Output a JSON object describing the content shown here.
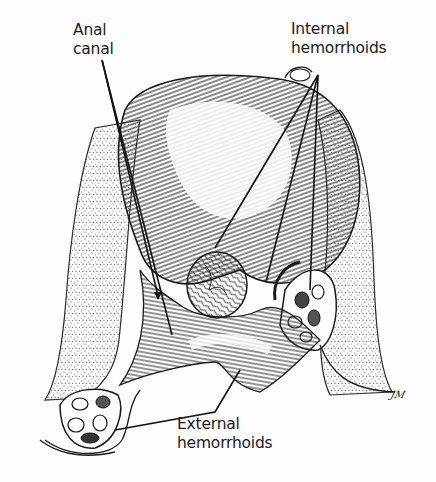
{
  "figure": {
    "type": "anatomical line illustration",
    "style": {
      "ink_color": "#1a1a1a",
      "paper_color": "#fdfdfd",
      "stipple_color": "#555555"
    }
  },
  "labels": {
    "anal_canal": {
      "lines": [
        "Anal",
        "canal"
      ]
    },
    "internal_hemorrhoids": {
      "lines": [
        "Internal",
        "hemorrhoids"
      ]
    },
    "external_hemorrhoids": {
      "lines": [
        "External",
        "hemorrhoids"
      ]
    }
  },
  "signature": "JM",
  "leader_lines": {
    "anal_canal": [
      {
        "from": [
          102,
          60
        ],
        "to": [
          158,
          296
        ]
      },
      {
        "from": [
          102,
          60
        ],
        "to": [
          172,
          335
        ]
      }
    ],
    "internal_hemorrhoids": [
      {
        "from": [
          318,
          75
        ],
        "to": [
          215,
          248
        ]
      },
      {
        "from": [
          318,
          75
        ],
        "to": [
          266,
          282
        ]
      },
      {
        "from": [
          318,
          75
        ],
        "to": [
          310,
          290
        ]
      }
    ],
    "external_hemorrhoids": [
      {
        "from": [
          240,
          370
        ],
        "to": [
          215,
          412
        ]
      },
      {
        "from": [
          215,
          412
        ],
        "to": [
          115,
          430
        ]
      }
    ]
  }
}
